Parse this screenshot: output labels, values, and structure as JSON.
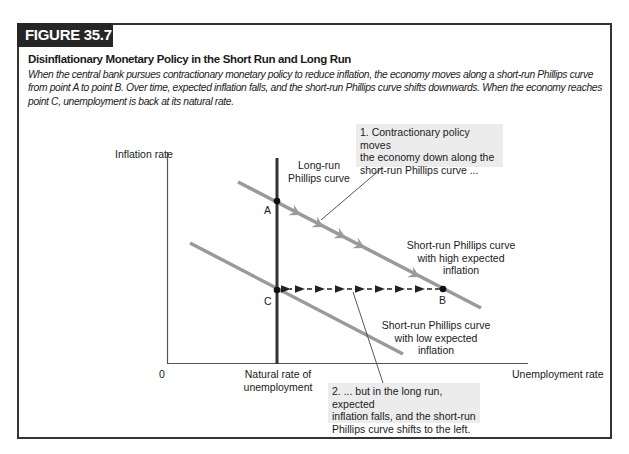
{
  "figure": {
    "tag": "FIGURE 35.7",
    "title": "Disinflationary Monetary Policy in the Short Run and Long Run",
    "caption": "When the central bank pursues contractionary monetary policy to reduce inflation, the economy moves along a short-run Phillips curve from point A to point B. Over time, expected inflation falls, and the short-run Phillips curve shifts downwards. When the economy reaches point C, unemployment is back at its natural rate.",
    "accent_color": "#262626"
  },
  "diagram": {
    "y_axis_label": "Inflation rate",
    "x_axis_label": "Unemployment rate",
    "origin_label": "0",
    "lrpc_label_line1": "Long-run",
    "lrpc_label_line2": "Phillips curve",
    "natural_rate_line1": "Natural rate of",
    "natural_rate_line2": "unemployment",
    "srpc_high_line1": "Short-run Phillips curve",
    "srpc_high_line2": "with high expected",
    "srpc_high_line3": "inflation",
    "srpc_low_line1": "Short-run Phillips curve",
    "srpc_low_line2": "with low expected",
    "srpc_low_line3": "inflation",
    "points": {
      "a": "A",
      "b": "B",
      "c": "C"
    },
    "callout1_line1": "1. Contractionary policy moves",
    "callout1_line2": "the economy down along the",
    "callout1_line3": "short-run Phillips curve ...",
    "callout2_line1": "2. ... but in the long run, expected",
    "callout2_line2": "inflation falls, and the short-run",
    "callout2_line3": "Phillips curve shifts to the left.",
    "colors": {
      "srpc": "#9a9a9a",
      "lrpc": "#333333",
      "axis": "#444444",
      "callout_bg": "#ececec"
    }
  }
}
